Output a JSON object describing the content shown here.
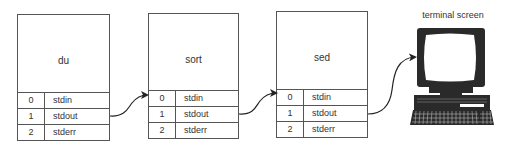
{
  "processes": [
    {
      "name": "du",
      "fds": [
        {
          "num": "0",
          "name": "stdin"
        },
        {
          "num": "1",
          "name": "stdout"
        },
        {
          "num": "2",
          "name": "stderr"
        }
      ]
    },
    {
      "name": "sort",
      "fds": [
        {
          "num": "0",
          "name": "stdin"
        },
        {
          "num": "1",
          "name": "stdout"
        },
        {
          "num": "2",
          "name": "stderr"
        }
      ]
    },
    {
      "name": "sed",
      "fds": [
        {
          "num": "0",
          "name": "stdin"
        },
        {
          "num": "1",
          "name": "stdout"
        },
        {
          "num": "2",
          "name": "stderr"
        }
      ]
    }
  ],
  "terminal": {
    "label": "terminal screen",
    "icon": "computer-terminal-icon"
  },
  "connections": [
    {
      "from": "du.stdout",
      "to": "sort.stdin"
    },
    {
      "from": "sort.stdout",
      "to": "sed.stdin"
    },
    {
      "from": "sed.stdout",
      "to": "terminal screen"
    }
  ],
  "colors": {
    "line": "#555555",
    "text": "#333333",
    "terminal": "#2a2a2a"
  }
}
